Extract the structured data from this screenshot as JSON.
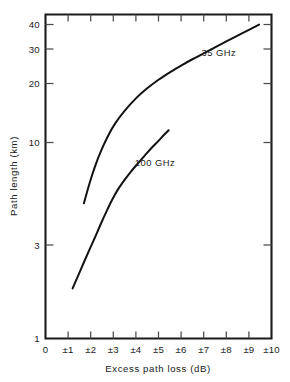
{
  "chart_data": {
    "type": "line",
    "title": "",
    "xlabel": "Excess path loss (dB)",
    "ylabel": "Path length (km)",
    "xlim": [
      0,
      10
    ],
    "ylim": [
      1,
      45
    ],
    "yscale": "log",
    "xscale": "linear",
    "grid": false,
    "legend_position": "inline-annotation",
    "x_tick_labels": [
      "0",
      "±1",
      "±2",
      "±3",
      "±4",
      "±5",
      "±6",
      "±7",
      "±8",
      "±9",
      "±10"
    ],
    "x_tick_values": [
      0,
      1,
      2,
      3,
      4,
      5,
      6,
      7,
      8,
      9,
      10
    ],
    "y_tick_labels": [
      "1",
      "3",
      "10",
      "20",
      "30",
      "40"
    ],
    "y_tick_values": [
      1,
      3,
      10,
      20,
      30,
      40
    ],
    "series": [
      {
        "name": "35 GHz",
        "label": "35 GHz",
        "label_x": 6.9,
        "label_y": 27.5,
        "color": "#121212",
        "points": [
          {
            "x": 1.7,
            "y": 4.9
          },
          {
            "x": 1.95,
            "y": 6.2
          },
          {
            "x": 2.2,
            "y": 7.6
          },
          {
            "x": 2.5,
            "y": 9.3
          },
          {
            "x": 2.8,
            "y": 11.0
          },
          {
            "x": 3.1,
            "y": 12.6
          },
          {
            "x": 3.5,
            "y": 14.5
          },
          {
            "x": 4.0,
            "y": 16.8
          },
          {
            "x": 4.5,
            "y": 18.9
          },
          {
            "x": 5.0,
            "y": 20.9
          },
          {
            "x": 5.5,
            "y": 22.8
          },
          {
            "x": 6.0,
            "y": 24.7
          },
          {
            "x": 6.5,
            "y": 26.6
          },
          {
            "x": 7.0,
            "y": 28.5
          },
          {
            "x": 7.5,
            "y": 30.6
          },
          {
            "x": 8.0,
            "y": 32.8
          },
          {
            "x": 8.5,
            "y": 35.1
          },
          {
            "x": 9.0,
            "y": 37.6
          },
          {
            "x": 9.45,
            "y": 40.0
          }
        ]
      },
      {
        "name": "100 GHz",
        "label": "100 GHz",
        "label_x": 3.95,
        "label_y": 7.6,
        "color": "#121212",
        "points": [
          {
            "x": 1.2,
            "y": 1.8
          },
          {
            "x": 1.45,
            "y": 2.1
          },
          {
            "x": 1.7,
            "y": 2.45
          },
          {
            "x": 1.95,
            "y": 2.85
          },
          {
            "x": 2.2,
            "y": 3.3
          },
          {
            "x": 2.45,
            "y": 3.85
          },
          {
            "x": 2.7,
            "y": 4.45
          },
          {
            "x": 2.95,
            "y": 5.1
          },
          {
            "x": 3.2,
            "y": 5.75
          },
          {
            "x": 3.5,
            "y": 6.45
          },
          {
            "x": 3.8,
            "y": 7.15
          },
          {
            "x": 4.1,
            "y": 7.85
          },
          {
            "x": 4.4,
            "y": 8.6
          },
          {
            "x": 4.7,
            "y": 9.4
          },
          {
            "x": 5.0,
            "y": 10.2
          },
          {
            "x": 5.25,
            "y": 10.95
          },
          {
            "x": 5.45,
            "y": 11.55
          }
        ]
      }
    ]
  }
}
